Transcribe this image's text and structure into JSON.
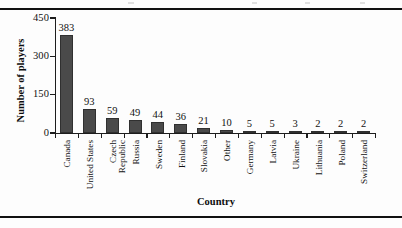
{
  "chart_data": {
    "type": "bar",
    "title": "",
    "xlabel": "Country",
    "ylabel": "Number of players",
    "categories": [
      "Canada",
      "United States",
      "Czech Republic",
      "Russia",
      "Sweden",
      "Finland",
      "Slovakia",
      "Other",
      "Germany",
      "Latvia",
      "Ukraine",
      "Lithuania",
      "Poland",
      "Switzerland"
    ],
    "values": [
      383,
      93,
      59,
      49,
      44,
      36,
      21,
      10,
      5,
      5,
      3,
      2,
      2,
      2
    ],
    "ylim": [
      0,
      450
    ],
    "yticks": [
      0,
      150,
      300,
      450
    ],
    "ytick_labels": [
      "0",
      "150",
      "300",
      "450"
    ],
    "grid": false,
    "legend": false,
    "bar_color": "#4a4a4a",
    "axis_color": "#1d1d1d",
    "data_labels": true
  },
  "figure": {
    "background": "#fdfdfd",
    "rule_color": "#111111"
  }
}
